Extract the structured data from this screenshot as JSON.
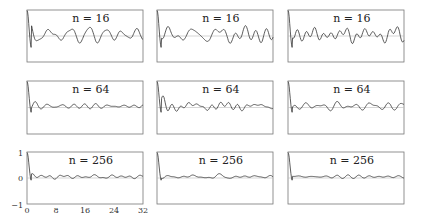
{
  "chart_data": {
    "type": "line",
    "title": "",
    "layout": "3x3 grid of small multiples",
    "xlim": [
      0,
      32
    ],
    "ylim": [
      -1,
      1
    ],
    "xticks": [
      "0",
      "8",
      "16",
      "24",
      "32"
    ],
    "yticks": [
      "-1",
      "0",
      "1"
    ],
    "grid": false,
    "panels": [
      {
        "row": 0,
        "col": 0,
        "label": "n = 16"
      },
      {
        "row": 0,
        "col": 1,
        "label": "n = 16"
      },
      {
        "row": 0,
        "col": 2,
        "label": "n = 16"
      },
      {
        "row": 1,
        "col": 0,
        "label": "n = 64"
      },
      {
        "row": 1,
        "col": 1,
        "label": "n = 64"
      },
      {
        "row": 1,
        "col": 2,
        "label": "n = 64"
      },
      {
        "row": 2,
        "col": 0,
        "label": "n = 256"
      },
      {
        "row": 2,
        "col": 1,
        "label": "n = 256"
      },
      {
        "row": 2,
        "col": 2,
        "label": "n = 256"
      }
    ]
  },
  "labels": {
    "r0": "n = 16",
    "r1": "n = 64",
    "r2": "n = 256",
    "x0": "0",
    "x8": "8",
    "x16": "16",
    "x24": "24",
    "x32": "32",
    "y1": "1",
    "y0": "0",
    "ym1": "−1"
  }
}
